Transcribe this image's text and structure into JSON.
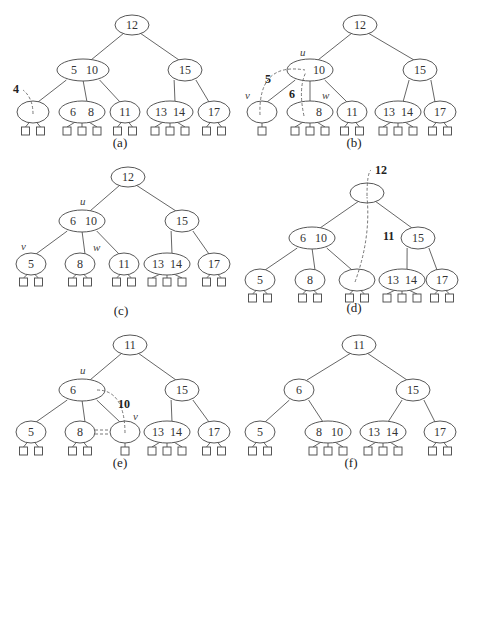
{
  "figure": {
    "panels": [
      {
        "id": "a",
        "caption": "(a)",
        "tree": {
          "keys": [
            "12"
          ],
          "children": [
            {
              "keys": [
                "5",
                "10"
              ],
              "children": [
                {
                  "keys": [],
                  "leaves": 2,
                  "empty": true
                },
                {
                  "keys": [
                    "6",
                    "8"
                  ],
                  "leaves": 3
                },
                {
                  "keys": [
                    "11"
                  ],
                  "leaves": 2
                }
              ]
            },
            {
              "keys": [
                "15"
              ],
              "children": [
                {
                  "keys": [
                    "13",
                    "14"
                  ],
                  "leaves": 3
                },
                {
                  "keys": [
                    "17"
                  ],
                  "leaves": 2
                }
              ]
            }
          ]
        },
        "annotations": [
          {
            "text": "4",
            "kind": "removed-key"
          }
        ],
        "node_labels": []
      },
      {
        "id": "b",
        "caption": "(b)",
        "tree": {
          "keys": [
            "12"
          ],
          "children": [
            {
              "keys": [
                "",
                "10"
              ],
              "children": [
                {
                  "keys": [],
                  "leaves": 1,
                  "empty": true
                },
                {
                  "keys": [
                    "",
                    "8"
                  ],
                  "leaves": 3
                },
                {
                  "keys": [
                    "11"
                  ],
                  "leaves": 2
                }
              ]
            },
            {
              "keys": [
                "15"
              ],
              "children": [
                {
                  "keys": [
                    "13",
                    "14"
                  ],
                  "leaves": 3
                },
                {
                  "keys": [
                    "17"
                  ],
                  "leaves": 2
                }
              ]
            }
          ]
        },
        "annotations": [
          {
            "text": "5",
            "kind": "moved-key"
          },
          {
            "text": "6",
            "kind": "moved-key"
          }
        ],
        "node_labels": [
          "u",
          "v",
          "w"
        ]
      },
      {
        "id": "c",
        "caption": "(c)",
        "tree": {
          "keys": [
            "12"
          ],
          "children": [
            {
              "keys": [
                "6",
                "10"
              ],
              "children": [
                {
                  "keys": [
                    "5"
                  ],
                  "leaves": 2
                },
                {
                  "keys": [
                    "8"
                  ],
                  "leaves": 2
                },
                {
                  "keys": [
                    "11"
                  ],
                  "leaves": 2
                }
              ]
            },
            {
              "keys": [
                "15"
              ],
              "children": [
                {
                  "keys": [
                    "13",
                    "14"
                  ],
                  "leaves": 3
                },
                {
                  "keys": [
                    "17"
                  ],
                  "leaves": 2
                }
              ]
            }
          ]
        },
        "annotations": [],
        "node_labels": [
          "u",
          "v",
          "w"
        ]
      },
      {
        "id": "d",
        "caption": "(d)",
        "tree": {
          "keys": [],
          "children": [
            {
              "keys": [
                "6",
                "10"
              ],
              "children": [
                {
                  "keys": [
                    "5"
                  ],
                  "leaves": 2
                },
                {
                  "keys": [
                    "8"
                  ],
                  "leaves": 2
                },
                {
                  "keys": [],
                  "leaves": 2,
                  "empty": true
                }
              ]
            },
            {
              "keys": [
                "15"
              ],
              "children": [
                {
                  "keys": [
                    "13",
                    "14"
                  ],
                  "leaves": 3
                },
                {
                  "keys": [
                    "17"
                  ],
                  "leaves": 2
                }
              ]
            }
          ]
        },
        "annotations": [
          {
            "text": "12",
            "kind": "removed-key"
          },
          {
            "text": "11",
            "kind": "moved-key"
          }
        ],
        "node_labels": []
      },
      {
        "id": "e",
        "caption": "(e)",
        "tree": {
          "keys": [
            "11"
          ],
          "children": [
            {
              "keys": [
                "6",
                ""
              ],
              "children": [
                {
                  "keys": [
                    "5"
                  ],
                  "leaves": 2
                },
                {
                  "keys": [
                    "8"
                  ],
                  "leaves": 2
                },
                {
                  "keys": [],
                  "leaves": 1,
                  "empty": true
                }
              ]
            },
            {
              "keys": [
                "15"
              ],
              "children": [
                {
                  "keys": [
                    "13",
                    "14"
                  ],
                  "leaves": 3
                },
                {
                  "keys": [
                    "17"
                  ],
                  "leaves": 2
                }
              ]
            }
          ]
        },
        "annotations": [
          {
            "text": "10",
            "kind": "moved-key"
          }
        ],
        "node_labels": [
          "u",
          "v"
        ]
      },
      {
        "id": "f",
        "caption": "(f)",
        "tree": {
          "keys": [
            "11"
          ],
          "children": [
            {
              "keys": [
                "6"
              ],
              "children": [
                {
                  "keys": [
                    "5"
                  ],
                  "leaves": 2
                },
                {
                  "keys": [
                    "8",
                    "10"
                  ],
                  "leaves": 3
                }
              ]
            },
            {
              "keys": [
                "15"
              ],
              "children": [
                {
                  "keys": [
                    "13",
                    "14"
                  ],
                  "leaves": 3
                },
                {
                  "keys": [
                    "17"
                  ],
                  "leaves": 2
                }
              ]
            }
          ]
        },
        "annotations": [],
        "node_labels": [
          "u"
        ]
      },
      {
        "id": "g",
        "caption": "(g)",
        "tree": {
          "keys": [
            "11"
          ],
          "children": [
            {
              "keys": [
                "6"
              ],
              "children": [
                {
                  "keys": [
                    "5"
                  ],
                  "leaves": 2
                },
                {
                  "keys": [
                    "8",
                    "10"
                  ],
                  "leaves": 3
                }
              ]
            },
            {
              "keys": [
                "15"
              ],
              "children": [
                {
                  "keys": [
                    "",
                    "14"
                  ],
                  "leaves": 3
                },
                {
                  "keys": [
                    "17"
                  ],
                  "leaves": 2
                }
              ]
            }
          ]
        },
        "annotations": [
          {
            "text": "13",
            "kind": "removed-key"
          }
        ],
        "node_labels": []
      },
      {
        "id": "h",
        "caption": "(h)",
        "tree": {
          "keys": [
            "11"
          ],
          "children": [
            {
              "keys": [
                "6"
              ],
              "children": [
                {
                  "keys": [
                    "5"
                  ],
                  "leaves": 2
                },
                {
                  "keys": [
                    "8",
                    "10"
                  ],
                  "leaves": 3
                }
              ]
            },
            {
              "keys": [
                "15"
              ],
              "children": [
                {
                  "keys": [
                    "14"
                  ],
                  "leaves": 2
                },
                {
                  "keys": [
                    "17"
                  ],
                  "leaves": 2
                }
              ]
            }
          ]
        },
        "annotations": [],
        "node_labels": []
      }
    ]
  }
}
